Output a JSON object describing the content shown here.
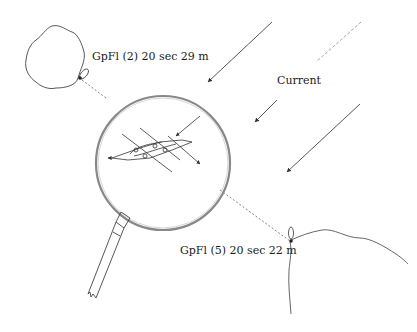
{
  "labels": {
    "light_top": "GpFl (2) 20 sec 29 m",
    "light_bottom": "GpFl (5) 20 sec 22 m",
    "current": "Current"
  },
  "colors": {
    "line": "#444444",
    "lens_ring": "#888888",
    "dotted": "#666666"
  }
}
